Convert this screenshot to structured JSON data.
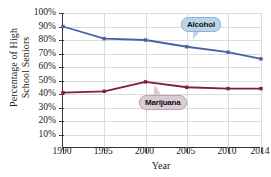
{
  "chart_data": {
    "type": "line",
    "title": "",
    "xlabel": "Year",
    "ylabel": "Percentage of High School Seniors",
    "ylabel_line1": "Percentage of High",
    "ylabel_line2": "School Seniors",
    "x": [
      1990,
      1995,
      2000,
      2005,
      2010,
      2014
    ],
    "categories": [
      "1990",
      "1995",
      "2000",
      "2005",
      "2010",
      "2014"
    ],
    "xlim": [
      1990,
      2014
    ],
    "ylim": [
      0,
      100
    ],
    "yticks": [
      10,
      20,
      30,
      40,
      50,
      60,
      70,
      80,
      90,
      100
    ],
    "ytick_labels": [
      "10%",
      "20%",
      "30%",
      "40%",
      "50%",
      "60%",
      "70%",
      "80%",
      "90%",
      "100%"
    ],
    "grid": true,
    "legend_position": "inline-callouts",
    "series": [
      {
        "name": "Alcohol",
        "color": "#4f5fa6",
        "marker": "square",
        "values": [
          90,
          81,
          80,
          75,
          71,
          66
        ]
      },
      {
        "name": "Marijuana",
        "color": "#7d1f3d",
        "marker": "square",
        "values": [
          41,
          42,
          49,
          45,
          44,
          44
        ]
      }
    ],
    "annotations": [
      {
        "id": "alcohol-callout",
        "text": "Alcohol",
        "fill": "#bcd4ea",
        "border": "#8fb2d4"
      },
      {
        "id": "marijuana-callout",
        "text": "Marijuana",
        "fill": "#d9ccd4",
        "border": "#b9a4b1"
      }
    ]
  }
}
